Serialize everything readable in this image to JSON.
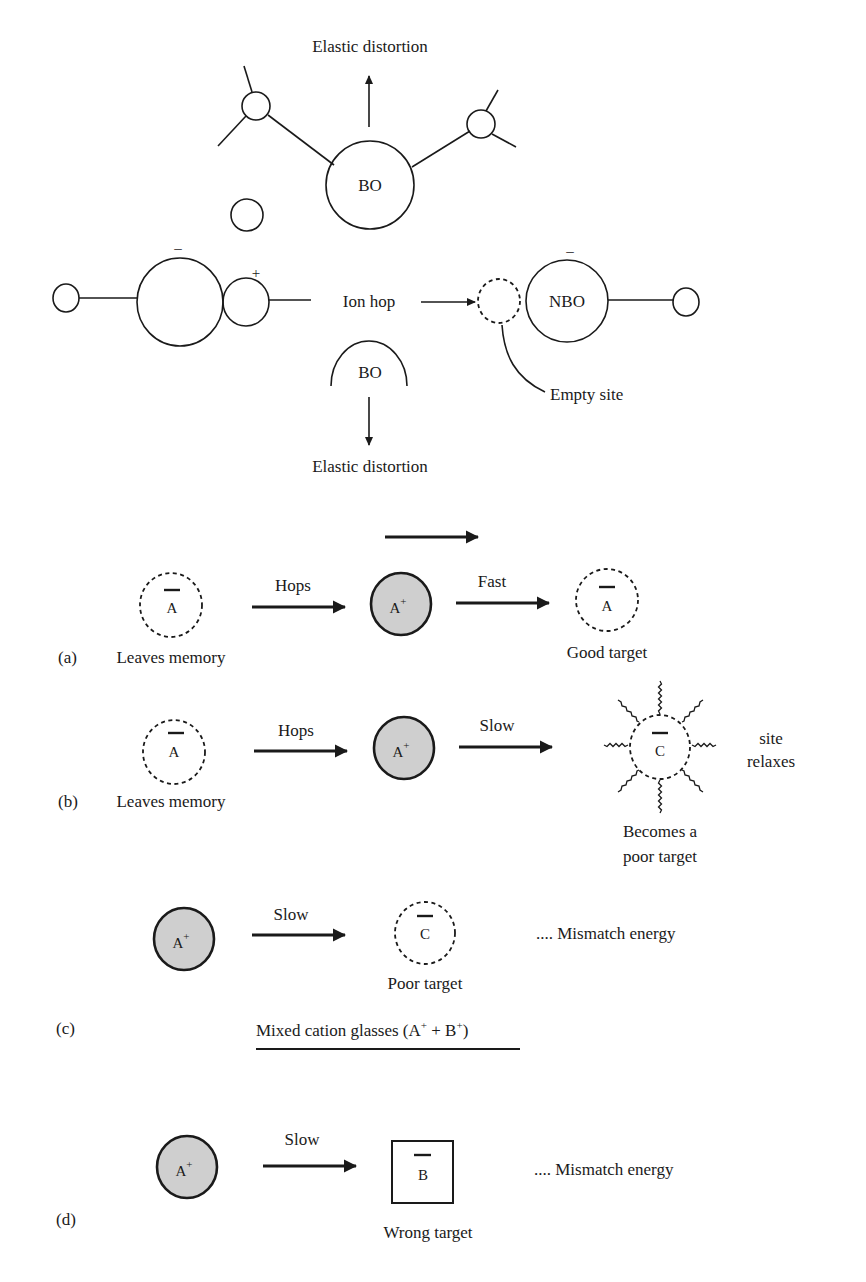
{
  "top_diagram": {
    "elastic_distortion_top": "Elastic distortion",
    "elastic_distortion_bottom": "Elastic distortion",
    "bo_top": "BO",
    "bo_bottom": "BO",
    "nbo": "NBO",
    "ion_hop": "Ion hop",
    "empty_site": "Empty site",
    "minus_left": "–",
    "plus": "+",
    "minus_right": "–"
  },
  "panel_a": {
    "tag": "(a)",
    "site1_label": "A",
    "site1_caption": "Leaves memory",
    "arrow1_label": "Hops",
    "ion_label": "A",
    "ion_charge": "+",
    "arrow2_label": "Fast",
    "site2_label": "A",
    "site2_caption": "Good target"
  },
  "panel_b": {
    "tag": "(b)",
    "site1_label": "A",
    "site1_caption": "Leaves memory",
    "arrow1_label": "Hops",
    "ion_label": "A",
    "ion_charge": "+",
    "arrow2_label": "Slow",
    "site2_label": "C",
    "site2_caption_line1": "Becomes a",
    "site2_caption_line2": "poor target",
    "side_note_line1": "site",
    "side_note_line2": "relaxes"
  },
  "panel_c": {
    "tag": "(c)",
    "ion_label": "A",
    "ion_charge": "+",
    "arrow_label": "Slow",
    "site_label": "C",
    "site_caption": "Poor target",
    "note": ".... Mismatch energy"
  },
  "mixed_title": {
    "text": "Mixed cation glasses (A",
    "sup1": "+",
    "mid": " + B",
    "sup2": "+",
    "end": ")"
  },
  "panel_d": {
    "tag": "(d)",
    "ion_label": "A",
    "ion_charge": "+",
    "arrow_label": "Slow",
    "site_label": "B",
    "site_caption": "Wrong target",
    "note": ".... Mismatch energy"
  }
}
